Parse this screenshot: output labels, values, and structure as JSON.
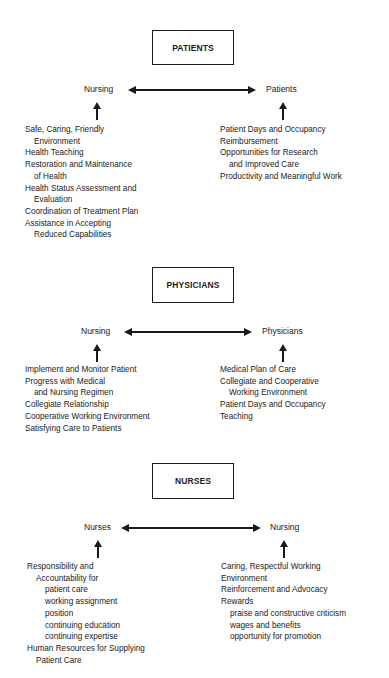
{
  "sections": [
    {
      "title": "PATIENTS",
      "left_node": "Nursing",
      "right_node": "Patients",
      "left_items": [
        {
          "text": "Safe, Caring, Friendly",
          "indent": 0
        },
        {
          "text": "Environment",
          "indent": 1
        },
        {
          "text": "Health Teaching",
          "indent": 0
        },
        {
          "text": "Restoration and Maintenance",
          "indent": 0
        },
        {
          "text": "of Health",
          "indent": 1
        },
        {
          "text": "Health Status Assessment and",
          "indent": 0
        },
        {
          "text": "Evaluation",
          "indent": 1
        },
        {
          "text": "Coordination of Treatment Plan",
          "indent": 0
        },
        {
          "text": "Assistance in Accepting",
          "indent": 0
        },
        {
          "text": "Reduced Capabilities",
          "indent": 1
        }
      ],
      "right_items": [
        {
          "text": "Patient Days and Occupancy",
          "indent": 0
        },
        {
          "text": "Reimbursement",
          "indent": 0
        },
        {
          "text": "Opportunities for Research",
          "indent": 0
        },
        {
          "text": "and Improved Care",
          "indent": 1
        },
        {
          "text": "Productivity and Meaningful Work",
          "indent": 0
        }
      ]
    },
    {
      "title": "PHYSICIANS",
      "left_node": "Nursing",
      "right_node": "Physicians",
      "left_items": [
        {
          "text": "Implement and Monitor Patient",
          "indent": 0
        },
        {
          "text": "Progress with Medical",
          "indent": 0
        },
        {
          "text": "and Nursing Regimen",
          "indent": 1
        },
        {
          "text": "Collegiate Relationship",
          "indent": 0
        },
        {
          "text": "Cooperative Working Environment",
          "indent": 0
        },
        {
          "text": "Satisfying Care to Patients",
          "indent": 0
        }
      ],
      "right_items": [
        {
          "text": "Medical Plan of Care",
          "indent": 0
        },
        {
          "text": "Collegiate and Cooperative",
          "indent": 0
        },
        {
          "text": "Working Environment",
          "indent": 1
        },
        {
          "text": "Patient Days and Occupancy",
          "indent": 0
        },
        {
          "text": "Teaching",
          "indent": 0
        }
      ]
    },
    {
      "title": "NURSES",
      "left_node": "Nurses",
      "right_node": "Nursing",
      "left_items": [
        {
          "text": "Responsibility and",
          "indent": 0
        },
        {
          "text": "Accountability for",
          "indent": 1
        },
        {
          "text": "patient care",
          "indent": 2
        },
        {
          "text": "working assignment",
          "indent": 2
        },
        {
          "text": "position",
          "indent": 2
        },
        {
          "text": "continuing education",
          "indent": 2
        },
        {
          "text": "continuing expertise",
          "indent": 2
        },
        {
          "text": "Human Resources for Supplying",
          "indent": 0
        },
        {
          "text": "Patient Care",
          "indent": 1
        }
      ],
      "right_items": [
        {
          "text": "Caring, Respectful Working",
          "indent": 0
        },
        {
          "text": "Environment",
          "indent": 0
        },
        {
          "text": "Reinforcement and Advocacy",
          "indent": 0
        },
        {
          "text": "Rewards",
          "indent": 0
        },
        {
          "text": "praise and constructive criticism",
          "indent": 1
        },
        {
          "text": "wages and benefits",
          "indent": 1
        },
        {
          "text": "opportunity for promotion",
          "indent": 1
        }
      ]
    }
  ]
}
